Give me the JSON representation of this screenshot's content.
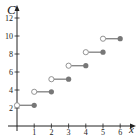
{
  "chart_data": {
    "type": "line",
    "subtype": "step",
    "title": "",
    "xlabel": "x",
    "ylabel": "C",
    "xlim": [
      0,
      6.5
    ],
    "ylim": [
      0,
      13
    ],
    "x_ticks": [
      1,
      2,
      3,
      4,
      5,
      6
    ],
    "y_ticks": [
      2,
      4,
      6,
      8,
      10,
      12
    ],
    "grid": false,
    "legend": null,
    "series": [
      {
        "name": "C(x)",
        "segments": [
          {
            "x_start": 0,
            "x_end": 1,
            "y": 2.3,
            "start_open": true,
            "end_closed": true
          },
          {
            "x_start": 1,
            "x_end": 2,
            "y": 3.8,
            "start_open": true,
            "end_closed": true
          },
          {
            "x_start": 2,
            "x_end": 3,
            "y": 5.2,
            "start_open": true,
            "end_closed": true
          },
          {
            "x_start": 3,
            "x_end": 4,
            "y": 6.7,
            "start_open": true,
            "end_closed": true
          },
          {
            "x_start": 4,
            "x_end": 5,
            "y": 8.2,
            "start_open": true,
            "end_closed": true
          },
          {
            "x_start": 5,
            "x_end": 6,
            "y": 9.7,
            "start_open": true,
            "end_closed": true
          }
        ]
      }
    ],
    "colors": {
      "axis": "#222222",
      "line": "#888888",
      "filled_point": "#777777",
      "open_point_fill": "#ffffff"
    }
  }
}
